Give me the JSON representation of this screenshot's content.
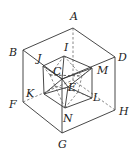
{
  "figure": {
    "cube_vertices": {
      "A": [
        73,
        28
      ],
      "B": [
        23,
        50
      ],
      "C": [
        62,
        79
      ],
      "D": [
        115,
        57
      ],
      "F": [
        23,
        102
      ],
      "G": [
        62,
        133
      ],
      "H": [
        115,
        110
      ],
      "back": [
        73,
        80
      ]
    },
    "icosahedron_vertices": {
      "I": [
        64,
        56
      ],
      "J": [
        43,
        66
      ],
      "C": [
        62,
        79
      ],
      "M": [
        92,
        68
      ],
      "K": [
        44,
        94
      ],
      "E": [
        68,
        87
      ],
      "L": [
        92,
        98
      ],
      "N": [
        65,
        108
      ],
      "X1": [
        82,
        76
      ],
      "X2": [
        55,
        86
      ],
      "X3": [
        78,
        92
      ],
      "X4": [
        50,
        75
      ]
    },
    "labels": [
      {
        "text": "A",
        "x": 70,
        "y": 20
      },
      {
        "text": "B",
        "x": 9,
        "y": 56
      },
      {
        "text": "I",
        "x": 64,
        "y": 51
      },
      {
        "text": "J",
        "x": 37,
        "y": 62
      },
      {
        "text": "D",
        "x": 118,
        "y": 61
      },
      {
        "text": "C",
        "x": 53,
        "y": 75
      },
      {
        "text": "M",
        "x": 97,
        "y": 74
      },
      {
        "text": "K",
        "x": 26,
        "y": 97
      },
      {
        "text": "E",
        "x": 68,
        "y": 91
      },
      {
        "text": "L",
        "x": 93,
        "y": 101
      },
      {
        "text": "F",
        "x": 9,
        "y": 108
      },
      {
        "text": "H",
        "x": 119,
        "y": 115
      },
      {
        "text": "N",
        "x": 63,
        "y": 122
      },
      {
        "text": "G",
        "x": 58,
        "y": 148
      }
    ]
  }
}
